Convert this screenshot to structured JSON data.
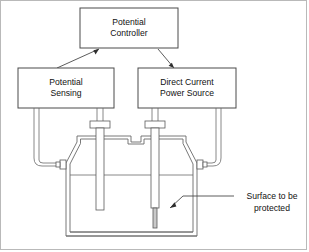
{
  "diagram": {
    "boxes": [
      {
        "id": "potential-controller",
        "line1": "Potential",
        "line2": "Controller",
        "x": 80,
        "y": 8,
        "w": 98,
        "h": 40
      },
      {
        "id": "potential-sensing",
        "line1": "Potential",
        "line2": "Sensing",
        "x": 18,
        "y": 68,
        "w": 96,
        "h": 40
      },
      {
        "id": "direct-current-power-source",
        "line1": "Direct Current",
        "line2": "Power Source",
        "x": 138,
        "y": 68,
        "w": 98,
        "h": 40
      }
    ],
    "annotations": [
      {
        "id": "surface-to-be-protected",
        "line1": "Surface to be",
        "line2": "protected",
        "x": 236,
        "y": 191
      }
    ],
    "parts": {
      "vessel": "electrolyte-tank",
      "left_electrode": "reference-electrode",
      "right_electrode": "anode-electrode",
      "left_port": "left-side-port",
      "right_port": "right-side-port",
      "liquid_level": "electrolyte-level-line"
    },
    "colors": {
      "stroke": "#3c3c3c",
      "line": "#555555",
      "light": "#9a9a9a",
      "text": "#111111",
      "frame": "#b9b9b9",
      "background": "#ffffff"
    }
  }
}
